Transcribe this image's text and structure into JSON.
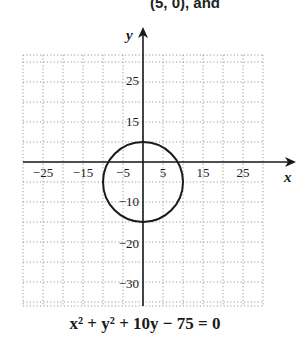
{
  "header_fragment": "(5, 0), and",
  "chart_data": {
    "type": "line",
    "title": "",
    "equation": "x^2 + y^2 + 10y - 75 = 0",
    "xlabel": "x",
    "ylabel": "y",
    "xlim": [
      -30,
      30
    ],
    "ylim": [
      -35,
      27
    ],
    "grid": true,
    "grid_step": 5,
    "x_tick_labels": [
      "-25",
      "-15",
      "-5",
      "5",
      "15",
      "25"
    ],
    "x_tick_values": [
      -25,
      -15,
      -5,
      5,
      15,
      25
    ],
    "y_tick_labels": [
      "25",
      "15",
      "-10",
      "-20",
      "-30"
    ],
    "y_tick_values": [
      25,
      15,
      -10,
      -20,
      -30
    ],
    "series": [
      {
        "name": "circle",
        "shape": "circle",
        "center": [
          0,
          -5
        ],
        "radius": 10
      }
    ]
  },
  "caption": {
    "text": "x² + y² + 10y − 75 = 0"
  },
  "colors": {
    "axis": "#1a1a1a",
    "grid": "#9a9a9a",
    "curve": "#1a1a1a"
  }
}
